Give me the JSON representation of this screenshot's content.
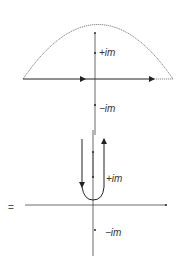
{
  "top_panel": {
    "labels": {
      "plus": "+im",
      "minus": "−im"
    },
    "contour": "semicircle-closed-upper"
  },
  "bottom_panel": {
    "equals": "=",
    "labels": {
      "plus": "+im",
      "minus": "−im"
    },
    "contour": "hairpin-around-upper-branch-cut"
  },
  "colors": {
    "line": "#333333",
    "dotted": "#666666"
  }
}
